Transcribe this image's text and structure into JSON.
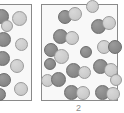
{
  "figure": {
    "type": "particle-diagram",
    "width": 124,
    "height": 113,
    "background_color": "#ffffff"
  },
  "colors": {
    "box_fill": "#f8f8f8",
    "box_border": "#8a8a8a",
    "dark_particle": "#8d8d8d",
    "dark_particle_border": "#6a6a6a",
    "light_particle": "#cfcfcf",
    "light_particle_border": "#9a9a9a",
    "caption_text": "#8d8d8d"
  },
  "boxes": [
    {
      "id": "left",
      "label": "",
      "clipped": true,
      "x": -22,
      "y": 4,
      "width": 54,
      "height": 97,
      "particle_count": 10
    },
    {
      "id": "right",
      "label": "2",
      "clipped": false,
      "x": 41,
      "y": 4,
      "width": 77,
      "height": 97,
      "particle_count": 24
    }
  ],
  "captions": {
    "right_box": "2"
  },
  "particles_left": [
    {
      "shade": "dark",
      "x": -6,
      "y": 9,
      "d": 15
    },
    {
      "shade": "light",
      "x": 12,
      "y": 11,
      "d": 15
    },
    {
      "shade": "dark",
      "x": -4,
      "y": 32,
      "d": 15
    },
    {
      "shade": "light",
      "x": 15,
      "y": 38,
      "d": 13
    },
    {
      "shade": "dark",
      "x": -5,
      "y": 51,
      "d": 15
    },
    {
      "shade": "light",
      "x": 10,
      "y": 59,
      "d": 14
    },
    {
      "shade": "dark",
      "x": -3,
      "y": 73,
      "d": 14
    },
    {
      "shade": "light",
      "x": 14,
      "y": 82,
      "d": 14
    },
    {
      "shade": "dark",
      "x": -7,
      "y": 88,
      "d": 13
    },
    {
      "shade": "light",
      "x": 1,
      "y": 20,
      "d": 12
    }
  ],
  "particles_right": [
    {
      "shade": "dark",
      "x": 58,
      "y": 10,
      "d": 14
    },
    {
      "shade": "light",
      "x": 68,
      "y": 7,
      "d": 14
    },
    {
      "shade": "dark",
      "x": 53,
      "y": 29,
      "d": 15
    },
    {
      "shade": "light",
      "x": 65,
      "y": 31,
      "d": 14
    },
    {
      "shade": "dark",
      "x": 44,
      "y": 43,
      "d": 14
    },
    {
      "shade": "light",
      "x": 54,
      "y": 49,
      "d": 15
    },
    {
      "shade": "dark",
      "x": 91,
      "y": 19,
      "d": 15
    },
    {
      "shade": "light",
      "x": 102,
      "y": 16,
      "d": 14
    },
    {
      "shade": "light",
      "x": 97,
      "y": 40,
      "d": 14
    },
    {
      "shade": "dark",
      "x": 108,
      "y": 40,
      "d": 14
    },
    {
      "shade": "dark",
      "x": 66,
      "y": 63,
      "d": 15
    },
    {
      "shade": "light",
      "x": 78,
      "y": 66,
      "d": 13
    },
    {
      "shade": "dark",
      "x": 93,
      "y": 59,
      "d": 15
    },
    {
      "shade": "light",
      "x": 104,
      "y": 63,
      "d": 14
    },
    {
      "shade": "light",
      "x": 41,
      "y": 74,
      "d": 13
    },
    {
      "shade": "dark",
      "x": 51,
      "y": 72,
      "d": 15
    },
    {
      "shade": "dark",
      "x": 64,
      "y": 85,
      "d": 15
    },
    {
      "shade": "light",
      "x": 76,
      "y": 86,
      "d": 14
    },
    {
      "shade": "dark",
      "x": 95,
      "y": 85,
      "d": 15
    },
    {
      "shade": "light",
      "x": 106,
      "y": 87,
      "d": 14
    },
    {
      "shade": "light",
      "x": 86,
      "y": 0,
      "d": 13
    },
    {
      "shade": "dark",
      "x": 44,
      "y": 58,
      "d": 12
    },
    {
      "shade": "light",
      "x": 110,
      "y": 74,
      "d": 12
    },
    {
      "shade": "dark",
      "x": 80,
      "y": 46,
      "d": 12
    }
  ]
}
